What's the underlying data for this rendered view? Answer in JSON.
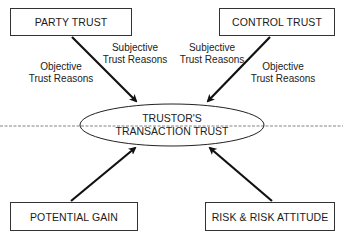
{
  "diagram": {
    "center": {
      "line1": "TRUSTOR'S",
      "line2": "TRANSACTION TRUST"
    },
    "boxes": {
      "party_trust": "PARTY TRUST",
      "control_trust": "CONTROL TRUST",
      "potential_gain": "POTENTIAL GAIN",
      "risk": "RISK & RISK ATTITUDE"
    },
    "edge_labels": {
      "party_subjective": {
        "line1": "Subjective",
        "line2": "Trust Reasons"
      },
      "party_objective": {
        "line1": "Objective",
        "line2": "Trust Reasons"
      },
      "control_subjective": {
        "line1": "Subjective",
        "line2": "Trust Reasons"
      },
      "control_objective": {
        "line1": "Objective",
        "line2": "Trust Reasons"
      }
    },
    "edges": [
      {
        "from": "PARTY TRUST",
        "to": "TRUSTOR'S TRANSACTION TRUST"
      },
      {
        "from": "CONTROL TRUST",
        "to": "TRUSTOR'S TRANSACTION TRUST"
      },
      {
        "from": "POTENTIAL GAIN",
        "to": "TRUSTOR'S TRANSACTION TRUST"
      },
      {
        "from": "RISK & RISK ATTITUDE",
        "to": "TRUSTOR'S TRANSACTION TRUST"
      }
    ],
    "colors": {
      "stroke": "#1a1a1a",
      "background": "#ffffff",
      "divider": "#555555"
    }
  }
}
